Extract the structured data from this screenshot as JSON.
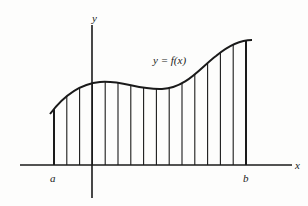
{
  "diagram": {
    "labels": {
      "y_axis": "y",
      "x_axis": "x",
      "function": "y = f(x)",
      "left_bound": "a",
      "right_bound": "b"
    },
    "partition_count": 15,
    "curve_shape": "rises from a to a local maximum just right of the y-axis, dips slightly, then rises to a maximum at b",
    "colors": {
      "ink": "#1a1a1a",
      "background": "#fdfdfc"
    }
  }
}
